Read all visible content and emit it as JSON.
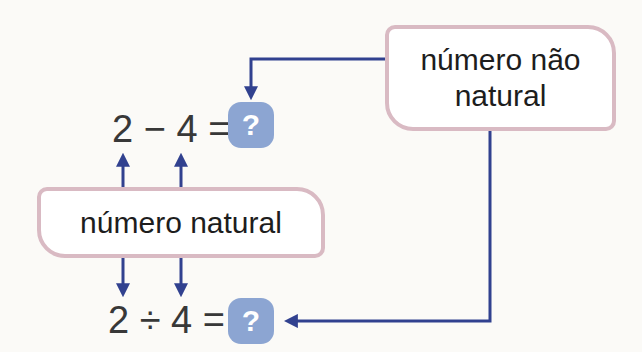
{
  "diagram": {
    "boxes": {
      "non_natural": {
        "label": "número não natural"
      },
      "natural": {
        "label": "número natural"
      }
    },
    "equations": {
      "subtraction": {
        "expression": "2 − 4 =",
        "result": "?"
      },
      "division": {
        "expression": "2 ÷ 4 =",
        "result": "?"
      }
    },
    "colors": {
      "arrow": "#31418f",
      "box_border": "#d9bac3",
      "box_fill": "#ffffff",
      "badge_fill": "#8ca5d2",
      "badge_text": "#ffffff",
      "equation_text": "#383838",
      "label_text": "#1d1d1d",
      "background": "#fbfaf7"
    }
  }
}
